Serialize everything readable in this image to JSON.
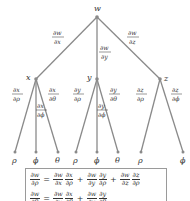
{
  "diagram": {
    "type": "tree",
    "root": {
      "label": "w",
      "x": 97,
      "y": 17
    },
    "level1": [
      {
        "label": "x",
        "x": 36,
        "y": 79,
        "edge_num": "∂w",
        "edge_den": "∂x"
      },
      {
        "label": "y",
        "x": 97,
        "y": 79,
        "edge_num": "∂w",
        "edge_den": "∂y"
      },
      {
        "label": "z",
        "x": 160,
        "y": 79,
        "edge_num": "∂w",
        "edge_den": "∂z"
      }
    ],
    "leaves": [
      {
        "parent": "x",
        "label": "ρ",
        "edge_num": "∂x",
        "edge_den": "∂ρ"
      },
      {
        "parent": "x",
        "label": "ϕ",
        "edge_num": "∂x",
        "edge_den": "∂ϕ"
      },
      {
        "parent": "x",
        "label": "θ",
        "edge_num": "∂x",
        "edge_den": "∂θ"
      },
      {
        "parent": "y",
        "label": "ρ",
        "edge_num": "∂y",
        "edge_den": "∂ρ"
      },
      {
        "parent": "y",
        "label": "ϕ",
        "edge_num": "∂y",
        "edge_den": "∂ϕ"
      },
      {
        "parent": "y",
        "label": "θ",
        "edge_num": "∂y",
        "edge_den": "∂θ"
      },
      {
        "parent": "z",
        "label": "ρ",
        "edge_num": "∂z",
        "edge_den": "∂ρ"
      },
      {
        "parent": "z",
        "label": "ϕ",
        "edge_num": "∂z",
        "edge_den": "∂ϕ"
      }
    ]
  },
  "formulas": {
    "f1": {
      "lhs": {
        "n": "∂w",
        "d": "∂ρ"
      },
      "eq": "=",
      "t1a": {
        "n": "∂w",
        "d": "∂x"
      },
      "t1b": {
        "n": "∂x",
        "d": "∂ρ"
      },
      "plus1": "+",
      "t2a": {
        "n": "∂w",
        "d": "∂y"
      },
      "t2b": {
        "n": "∂y",
        "d": "∂ρ"
      },
      "plus2": "+",
      "t3a": {
        "n": "∂w",
        "d": "∂z"
      },
      "t3b": {
        "n": "∂z",
        "d": "∂ρ"
      }
    },
    "f2": {
      "lhs": {
        "n": "∂w",
        "d": "∂θ"
      },
      "eq": "=",
      "t1a": {
        "n": "∂w",
        "d": "∂x"
      },
      "t1b": {
        "n": "∂x",
        "d": "∂θ"
      },
      "plus1": "+",
      "t2a": {
        "n": "∂w",
        "d": "∂y"
      },
      "t2b": {
        "n": "∂y",
        "d": "∂θ"
      }
    }
  }
}
